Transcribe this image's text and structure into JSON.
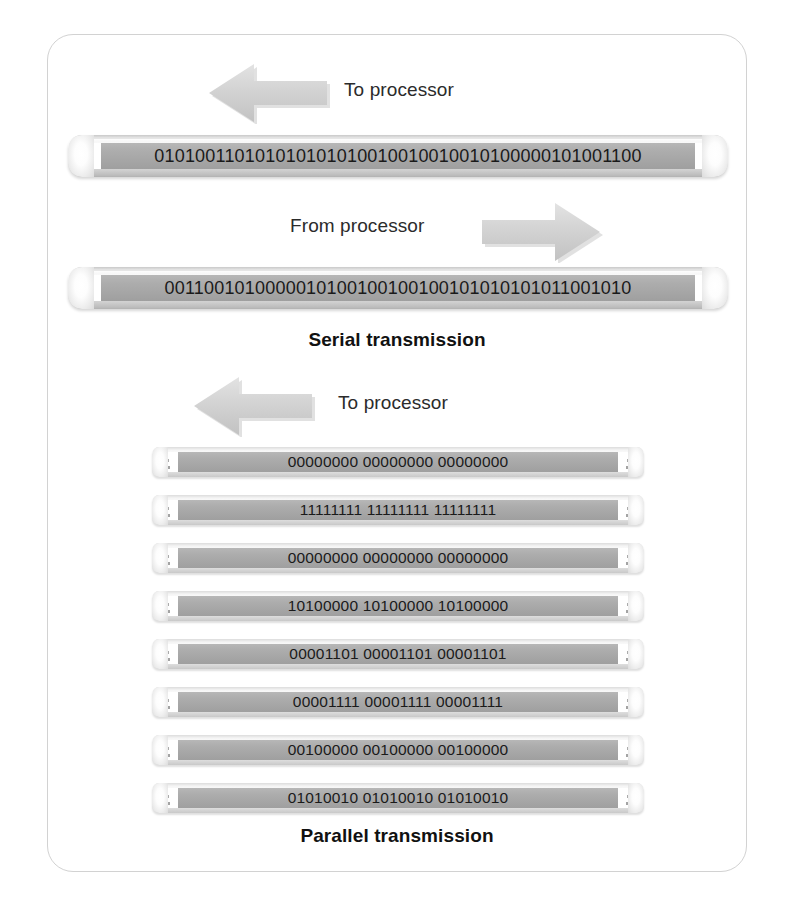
{
  "figure": {
    "panel_name": "serial-vs-parallel-transmission-figure",
    "border_color": "#d2d2d2",
    "background_color": "#ffffff",
    "ribbon_color": "#a8a8a8",
    "cable_color": "#e9e9e9",
    "arrow_color": "#cfcfcf",
    "text_color": "#2b2b2b"
  },
  "serial": {
    "caption": "Serial transmission",
    "to_processor_label": "To processor",
    "from_processor_label": "From processor",
    "to_processor_arrow": "arrow-left-icon",
    "from_processor_arrow": "arrow-right-icon",
    "lines": [
      {
        "direction": "to-processor",
        "bits": "010100110101010101010010010010010100000101001100"
      },
      {
        "direction": "from-processor",
        "bits": "0011001010000010100100100100101010101011001010"
      }
    ]
  },
  "parallel": {
    "caption": "Parallel transmission",
    "to_processor_label": "To processor",
    "to_processor_arrow": "arrow-left-icon",
    "lines": [
      {
        "index": 1,
        "bits": "00000000 00000000 00000000"
      },
      {
        "index": 2,
        "bits": "11111111 11111111 11111111"
      },
      {
        "index": 3,
        "bits": "00000000 00000000 00000000"
      },
      {
        "index": 4,
        "bits": "10100000 10100000 10100000"
      },
      {
        "index": 5,
        "bits": "00001101 00001101 00001101"
      },
      {
        "index": 6,
        "bits": "00001111 00001111 00001111"
      },
      {
        "index": 7,
        "bits": "00100000 00100000 00100000"
      },
      {
        "index": 8,
        "bits": "01010010 01010010 01010010"
      }
    ]
  }
}
